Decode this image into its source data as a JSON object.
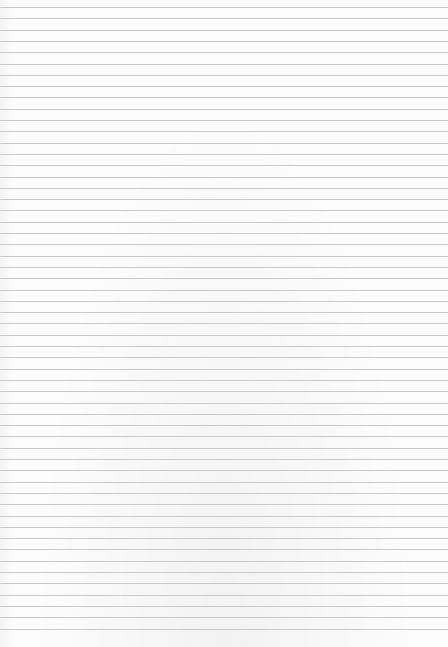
{
  "paper": {
    "type": "lined-paper",
    "background_color": "#fcfcfc",
    "line_color": "#c9c9c9",
    "first_line_y": 7,
    "line_spacing": 11.3,
    "line_count": 56
  }
}
